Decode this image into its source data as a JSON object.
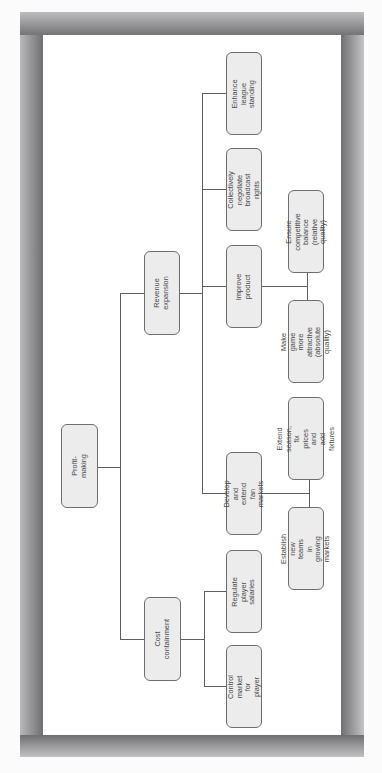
{
  "diagram": {
    "type": "hierarchy-tree",
    "orientation": "rotated-90-ccw",
    "root": {
      "label": "Profit-making"
    },
    "branches": [
      {
        "label": "Revenue expansion",
        "children": [
          {
            "label": "Enhance league\nstanding"
          },
          {
            "label": "Collectively negotiate\nbroadcast rights"
          },
          {
            "label": "Improve product",
            "children": [
              {
                "label": "Ensure competitive\nbalance (relative\nquality)"
              },
              {
                "label": "Make game more\nattractive (absolute\nquality)"
              }
            ]
          },
          {
            "label": "Develop and extend\nfan markets",
            "children": [
              {
                "label": "Extend season, fix\nprices and add\nfixtures"
              },
              {
                "label": "Establish new teams\nin growing markets"
              }
            ]
          }
        ]
      },
      {
        "label": "Cost containment",
        "children": [
          {
            "label": "Regulate player\nsalaries"
          },
          {
            "label": "Control market for\nplayer"
          }
        ]
      }
    ]
  },
  "colors": {
    "node_fill": "#ececed",
    "node_border": "#6e6e70",
    "connector": "#5e5e60",
    "panel": "#ffffff",
    "frame": "#8a8a8c"
  }
}
